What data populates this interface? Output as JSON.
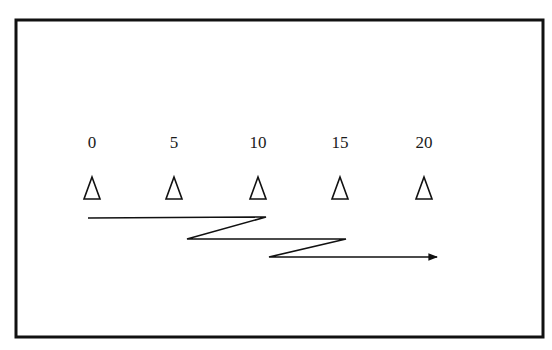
{
  "diagram": {
    "type": "drill-layout",
    "frame": {
      "x": 16,
      "y": 20,
      "width": 527,
      "height": 317,
      "stroke": "#111111"
    },
    "cones": [
      {
        "label": "0",
        "x": 92
      },
      {
        "label": "5",
        "x": 174
      },
      {
        "label": "10",
        "x": 258
      },
      {
        "label": "15",
        "x": 340
      },
      {
        "label": "20",
        "x": 424
      }
    ],
    "label_y": 134,
    "cone_apex_y": 177,
    "cone_base_y": 199,
    "cone_half_width": 8,
    "path": {
      "points": [
        [
          88,
          218
        ],
        [
          266,
          217
        ],
        [
          187,
          239
        ],
        [
          346,
          239
        ],
        [
          269,
          257
        ],
        [
          437,
          257
        ]
      ],
      "arrow_end": true,
      "stroke": "#111111"
    }
  }
}
